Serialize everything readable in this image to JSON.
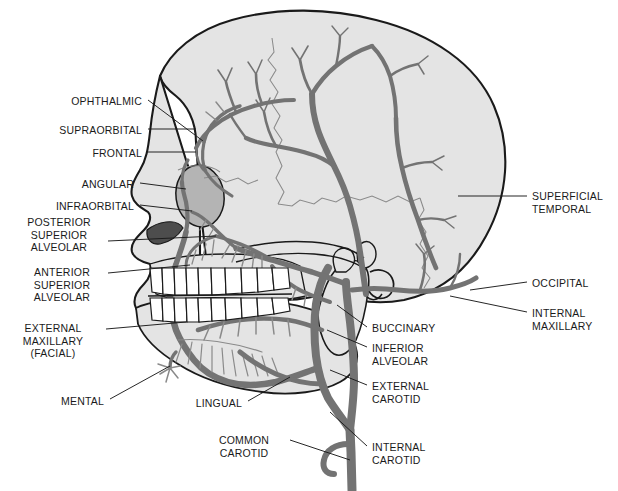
{
  "figure": {
    "type": "anatomical-diagram",
    "view": "lateral-skull",
    "colors": {
      "background": "#ffffff",
      "skull_fill": "#e4e4e4",
      "skull_fill_dark": "#c9c9c9",
      "orbit_fill": "#b4b4b4",
      "nasal_aperture": "#4d4d4d",
      "vessel": "#737373",
      "vessel_thin": "#8a8a8a",
      "outline": "#1a1a1a",
      "tooth_fill": "#ffffff",
      "label_text": "#1a1a1a",
      "leader_line": "#1a1a1a"
    }
  },
  "labels_left": [
    {
      "id": "ophthalmic",
      "lines": [
        "OPHTHALMIC"
      ],
      "x": 60,
      "y": 95,
      "align": "right",
      "anchor_x": 148,
      "anchor_y": 100,
      "target_x": 203,
      "target_y": 141
    },
    {
      "id": "supraorbital",
      "lines": [
        "SUPRAORBITAL"
      ],
      "x": 45,
      "y": 124,
      "align": "right",
      "anchor_x": 148,
      "anchor_y": 129,
      "target_x": 196,
      "target_y": 129
    },
    {
      "id": "frontal",
      "lines": [
        "FRONTAL"
      ],
      "x": 70,
      "y": 147,
      "align": "right",
      "anchor_x": 148,
      "anchor_y": 152,
      "target_x": 196,
      "target_y": 152
    },
    {
      "id": "angular",
      "lines": [
        "ANGULAR"
      ],
      "x": 46,
      "y": 178,
      "align": "right",
      "anchor_x": 140,
      "anchor_y": 183,
      "target_x": 186,
      "target_y": 189
    },
    {
      "id": "infraorbital",
      "lines": [
        "INFRAORBITAL"
      ],
      "x": 33,
      "y": 200,
      "align": "right",
      "anchor_x": 140,
      "anchor_y": 205,
      "target_x": 192,
      "target_y": 211
    },
    {
      "id": "posterior-superior-alveolar",
      "lines": [
        "POSTERIOR",
        "SUPERIOR",
        "ALVEOLAR"
      ],
      "x": 28,
      "y": 216,
      "align": "center",
      "anchor_x": 108,
      "anchor_y": 241,
      "target_x": 216,
      "target_y": 236
    },
    {
      "id": "anterior-superior-alveolar",
      "lines": [
        "ANTERIOR",
        "SUPERIOR",
        "ALVEOLAR"
      ],
      "x": 34,
      "y": 266,
      "align": "center",
      "anchor_x": 108,
      "anchor_y": 273,
      "target_x": 190,
      "target_y": 265
    },
    {
      "id": "external-maxillary-facial",
      "lines": [
        "EXTERNAL",
        "MAXILLARY",
        "(FACIAL)"
      ],
      "x": 18,
      "y": 322,
      "align": "center",
      "anchor_x": 106,
      "anchor_y": 329,
      "target_x": 186,
      "target_y": 322
    },
    {
      "id": "mental",
      "lines": [
        "MENTAL"
      ],
      "x": 56,
      "y": 395,
      "align": "right",
      "anchor_x": 110,
      "anchor_y": 399,
      "target_x": 170,
      "target_y": 366
    },
    {
      "id": "lingual",
      "lines": [
        "LINGUAL"
      ],
      "x": 198,
      "y": 397,
      "align": "right",
      "anchor_x": 248,
      "anchor_y": 401,
      "target_x": 290,
      "target_y": 377
    },
    {
      "id": "common-carotid",
      "lines": [
        "COMMON",
        "CAROTID"
      ],
      "x": 216,
      "y": 434,
      "align": "center",
      "anchor_x": 290,
      "anchor_y": 440,
      "target_x": 350,
      "target_y": 460
    }
  ],
  "labels_right": [
    {
      "id": "superficial-temporal",
      "lines": [
        "SUPERFICIAL",
        "TEMPORAL"
      ],
      "x": 532,
      "y": 190,
      "align": "left",
      "anchor_x": 527,
      "anchor_y": 196,
      "target_x": 458,
      "target_y": 196
    },
    {
      "id": "occipital",
      "lines": [
        "OCCIPITAL"
      ],
      "x": 532,
      "y": 277,
      "align": "left",
      "anchor_x": 527,
      "anchor_y": 282,
      "target_x": 470,
      "target_y": 290
    },
    {
      "id": "internal-maxillary",
      "lines": [
        "INTERNAL",
        "MAXILLARY"
      ],
      "x": 532,
      "y": 307,
      "align": "left",
      "anchor_x": 527,
      "anchor_y": 312,
      "target_x": 450,
      "target_y": 296
    },
    {
      "id": "buccinary",
      "lines": [
        "BUCCINARY"
      ],
      "x": 372,
      "y": 322,
      "align": "left",
      "anchor_x": 367,
      "anchor_y": 327,
      "target_x": 337,
      "target_y": 305
    },
    {
      "id": "inferior-alveolar",
      "lines": [
        "INFERIOR",
        "ALVEOLAR"
      ],
      "x": 372,
      "y": 342,
      "align": "left",
      "anchor_x": 367,
      "anchor_y": 347,
      "target_x": 327,
      "target_y": 330
    },
    {
      "id": "external-carotid",
      "lines": [
        "EXTERNAL",
        "CAROTID"
      ],
      "x": 372,
      "y": 380,
      "align": "left",
      "anchor_x": 367,
      "anchor_y": 385,
      "target_x": 330,
      "target_y": 370
    },
    {
      "id": "internal-carotid",
      "lines": [
        "INTERNAL",
        "CAROTID"
      ],
      "x": 372,
      "y": 441,
      "align": "left",
      "anchor_x": 367,
      "anchor_y": 446,
      "target_x": 330,
      "target_y": 412
    }
  ],
  "structures": [
    {
      "id": "cranium",
      "name": "cranial vault"
    },
    {
      "id": "orbit",
      "name": "orbital cavity"
    },
    {
      "id": "nasal-aperture",
      "name": "nasal aperture"
    },
    {
      "id": "maxilla",
      "name": "maxilla"
    },
    {
      "id": "mandible",
      "name": "mandible"
    },
    {
      "id": "upper-teeth",
      "name": "maxillary dentition"
    },
    {
      "id": "lower-teeth",
      "name": "mandibular dentition"
    },
    {
      "id": "zygomatic-arch",
      "name": "zygomatic arch"
    },
    {
      "id": "external-auditory-meatus",
      "name": "external auditory meatus"
    },
    {
      "id": "mastoid-process",
      "name": "mastoid process"
    }
  ],
  "vessels": [
    {
      "id": "common-carotid",
      "name": "common carotid artery"
    },
    {
      "id": "internal-carotid",
      "name": "internal carotid artery"
    },
    {
      "id": "external-carotid",
      "name": "external carotid artery"
    },
    {
      "id": "superior-thyroid",
      "name": "superior thyroid artery"
    },
    {
      "id": "lingual",
      "name": "lingual artery"
    },
    {
      "id": "external-maxillary",
      "name": "external maxillary (facial) artery"
    },
    {
      "id": "internal-maxillary",
      "name": "internal maxillary artery"
    },
    {
      "id": "inferior-alveolar",
      "name": "inferior alveolar artery"
    },
    {
      "id": "mental",
      "name": "mental artery"
    },
    {
      "id": "buccinary",
      "name": "buccinary artery"
    },
    {
      "id": "posterior-superior-alveolar",
      "name": "posterior superior alveolar artery"
    },
    {
      "id": "anterior-superior-alveolar",
      "name": "anterior superior alveolar artery"
    },
    {
      "id": "infraorbital",
      "name": "infraorbital artery"
    },
    {
      "id": "angular",
      "name": "angular artery"
    },
    {
      "id": "frontal",
      "name": "frontal artery"
    },
    {
      "id": "supraorbital",
      "name": "supraorbital artery"
    },
    {
      "id": "ophthalmic",
      "name": "ophthalmic artery"
    },
    {
      "id": "superficial-temporal",
      "name": "superficial temporal artery"
    },
    {
      "id": "occipital",
      "name": "occipital artery"
    }
  ]
}
